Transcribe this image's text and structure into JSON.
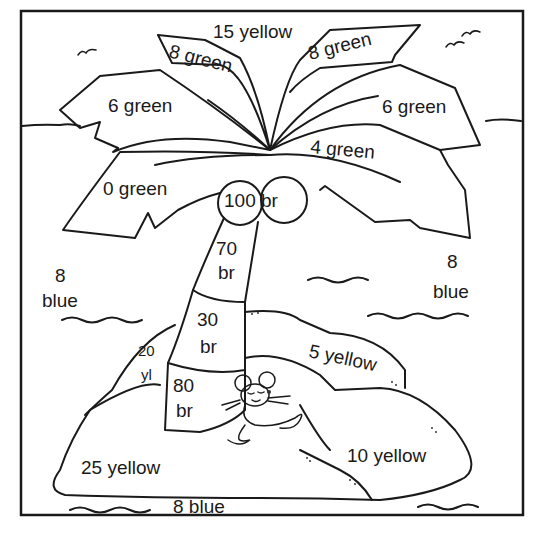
{
  "worksheet": {
    "type": "color-by-number illustration",
    "subject": "palm tree on island with resting mouse",
    "regions": {
      "sky_top": "15 yellow",
      "leaf_top_left": "8 green",
      "leaf_top_right": "8 green",
      "leaf_mid_left": "6 green",
      "leaf_mid_right": "6 green",
      "leaf_low_right": "4 green",
      "leaf_low_left": "0 green",
      "coconuts": "100 br",
      "trunk_upper_num": "70",
      "trunk_upper_unit": "br",
      "trunk_mid_num": "30",
      "trunk_mid_unit": "br",
      "trunk_low_num": "80",
      "trunk_low_unit": "br",
      "water_left_num": "8",
      "water_left_unit": "blue",
      "water_right_num": "8",
      "water_right_unit": "blue",
      "sand_small_num": "20",
      "sand_small_unit": "yl",
      "sand_ridge": "5 yellow",
      "sand_right": "10 yellow",
      "sand_left": "25 yellow",
      "water_bottom": "8 blue"
    },
    "colors": {
      "line": "#1a1a1a",
      "background": "#ffffff"
    }
  }
}
